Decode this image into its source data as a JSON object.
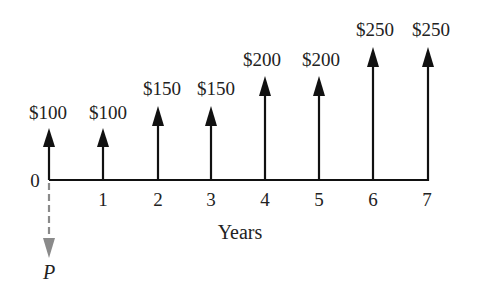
{
  "diagram": {
    "type": "cash-flow-diagram",
    "axis_label": "Years",
    "origin_label": "0",
    "present_value_label": "P",
    "periods": [
      "1",
      "2",
      "3",
      "4",
      "5",
      "6",
      "7"
    ],
    "cash_flows": [
      {
        "year": 0,
        "label": "$100",
        "amount": 100
      },
      {
        "year": 1,
        "label": "$100",
        "amount": 100
      },
      {
        "year": 2,
        "label": "$150",
        "amount": 150
      },
      {
        "year": 3,
        "label": "$150",
        "amount": 150
      },
      {
        "year": 4,
        "label": "$200",
        "amount": 200
      },
      {
        "year": 5,
        "label": "$200",
        "amount": 200
      },
      {
        "year": 6,
        "label": "$250",
        "amount": 250
      },
      {
        "year": 7,
        "label": "$250",
        "amount": 250
      }
    ],
    "colors": {
      "arrow": "#111111",
      "present_value_arrow": "#8a8a8a",
      "text": "#222222"
    }
  }
}
